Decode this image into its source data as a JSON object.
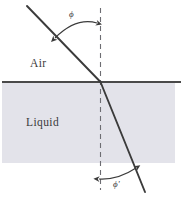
{
  "figure": {
    "type": "optics-refraction-diagram",
    "width": 185,
    "height": 207,
    "background_color": "#ffffff"
  },
  "media": {
    "upper": {
      "name": "air",
      "label": "Air",
      "fill_color": "#ffffff",
      "label_x": 30,
      "label_y": 67
    },
    "lower": {
      "name": "liquid",
      "label": "Liquid",
      "fill_color": "#e3e3ea",
      "label_x": 26,
      "label_y": 126
    }
  },
  "interface": {
    "name": "air-liquid-interface",
    "color": "#4a4a4a",
    "x1": 2,
    "y1": 82,
    "x2": 181,
    "y2": 82
  },
  "normal": {
    "name": "normal-dashed-line",
    "color": "#6d6d72",
    "dash": "5 4",
    "x": 100,
    "y_top": 8,
    "y_bottom": 190
  },
  "rays": {
    "incident": {
      "name": "incident-ray",
      "color": "#3b3b3b",
      "x1": 27,
      "y1": 6,
      "x2": 100,
      "y2": 82
    },
    "refracted": {
      "name": "refracted-ray",
      "color": "#3b3b3b",
      "x1": 100,
      "y1": 82,
      "x2": 145,
      "y2": 192
    }
  },
  "angles": {
    "incidence": {
      "name": "angle-of-incidence",
      "label": "ϕ",
      "label_x": 69,
      "label_y": 17,
      "arc_start_x": 55,
      "arc_start_y": 38,
      "arc_end_x": 97,
      "arc_end_y": 23,
      "value_degrees": 44
    },
    "refraction": {
      "name": "angle-of-refraction",
      "label": "ϕ'",
      "label_x": 113,
      "label_y": 187,
      "arc_start_x": 99,
      "arc_start_y": 179,
      "arc_end_x": 136,
      "arc_end_y": 168,
      "value_degrees": 22
    }
  }
}
